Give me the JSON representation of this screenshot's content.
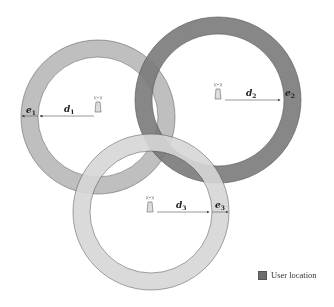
{
  "diagram": {
    "anchors": [
      {
        "id": 1,
        "cx": 98,
        "cy": 117,
        "outer_r": 77,
        "inner_r": 60,
        "fill": "#b9b9b9",
        "distance_label": "d",
        "distance_sub": "1",
        "error_label": "e",
        "error_sub": "1",
        "direction": "left"
      },
      {
        "id": 2,
        "cx": 218,
        "cy": 100,
        "outer_r": 83,
        "inner_r": 66,
        "fill": "#7a7a7a",
        "distance_label": "d",
        "distance_sub": "2",
        "error_label": "e",
        "error_sub": "2",
        "direction": "right"
      },
      {
        "id": 3,
        "cx": 151,
        "cy": 212,
        "outer_r": 78,
        "inner_r": 61,
        "fill": "#d6d6d6",
        "distance_label": "d",
        "distance_sub": "3",
        "error_label": "e",
        "error_sub": "3",
        "direction": "right"
      }
    ],
    "icon": "antenna-tower-icon"
  },
  "legend": {
    "label": "User location",
    "swatch_color": "#6e6e6e"
  }
}
